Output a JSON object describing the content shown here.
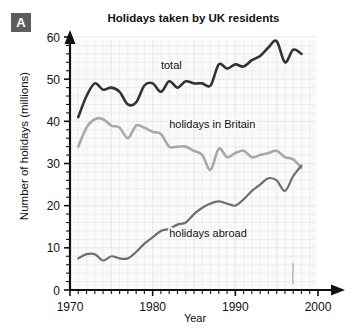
{
  "badge": {
    "label": "A"
  },
  "chart_data": {
    "type": "line",
    "title": "Holidays taken by UK residents",
    "xlabel": "Year",
    "ylabel": "Number of holidays (millions)",
    "xlim": [
      1970,
      2000
    ],
    "ylim": [
      0,
      60
    ],
    "xticks": [
      1970,
      1980,
      1990,
      2000
    ],
    "xtick_labels": [
      "1970",
      "1980",
      "1990",
      "2000"
    ],
    "yticks": [
      0,
      10,
      20,
      30,
      40,
      50,
      60
    ],
    "ytick_labels": [
      "0",
      "10",
      "20",
      "30",
      "40",
      "50",
      "60"
    ],
    "minor_tick_step_x": 1,
    "minor_tick_step_y": 2,
    "grid": true,
    "legend": "inline-annotations",
    "colors": {
      "total": "#333333",
      "britain": "#a8a8a8",
      "abroad": "#6e6e6e",
      "axis": "#111111",
      "grid": "#e8e8ec",
      "plot_background": "#fafafa",
      "badge": "#5d5d5d"
    },
    "x": [
      1971,
      1972,
      1973,
      1974,
      1975,
      1976,
      1977,
      1978,
      1979,
      1980,
      1981,
      1982,
      1983,
      1984,
      1985,
      1986,
      1987,
      1988,
      1989,
      1990,
      1991,
      1992,
      1993,
      1994,
      1995,
      1996,
      1997,
      1998
    ],
    "series": [
      {
        "name": "total",
        "label": "total",
        "label_x": 1981,
        "label_y": 52.5,
        "values": [
          41.0,
          46.0,
          49.0,
          47.5,
          48.0,
          47.0,
          44.0,
          44.5,
          48.5,
          49.0,
          47.0,
          49.5,
          48.0,
          49.5,
          49.0,
          49.0,
          48.5,
          53.5,
          52.5,
          53.5,
          53.0,
          54.5,
          55.5,
          57.5,
          59.0,
          54.0,
          57.0,
          56.0
        ]
      },
      {
        "name": "holidays in Britain",
        "label": "holidays in Britain",
        "label_x": 1982,
        "label_y": 38.5,
        "values": [
          34.0,
          38.5,
          40.5,
          40.5,
          39.0,
          38.5,
          36.0,
          39.0,
          38.5,
          37.5,
          37.0,
          34.0,
          34.0,
          34.0,
          33.0,
          32.0,
          28.5,
          33.5,
          31.5,
          32.5,
          33.0,
          31.5,
          32.0,
          32.5,
          33.0,
          31.5,
          31.0,
          29.0
        ]
      },
      {
        "name": "holidays abroad",
        "label": "holidays abroad",
        "label_x": 1982,
        "label_y": 12.5,
        "values": [
          7.5,
          8.5,
          8.5,
          7.0,
          8.0,
          7.5,
          7.5,
          9.0,
          11.0,
          12.5,
          14.0,
          14.5,
          15.5,
          16.0,
          18.0,
          19.5,
          20.5,
          21.0,
          20.5,
          20.0,
          21.5,
          23.5,
          25.0,
          26.5,
          26.0,
          23.5,
          27.0,
          29.5
        ]
      }
    ]
  }
}
